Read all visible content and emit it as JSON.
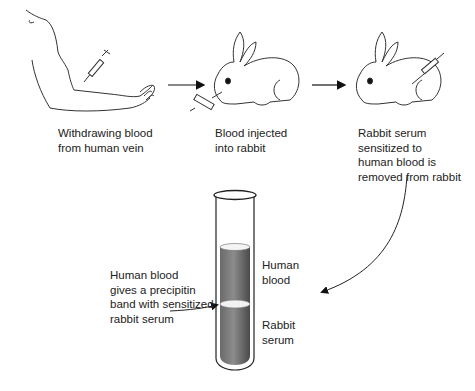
{
  "diagram": {
    "steps": [
      {
        "id": "withdraw",
        "label": "Withdrawing blood\nfrom human vein"
      },
      {
        "id": "inject",
        "label": "Blood injected\ninto rabbit"
      },
      {
        "id": "remove",
        "label": "Rabbit serum\nsensitized to\nhuman blood is\nremoved from rabbit"
      }
    ],
    "tube": {
      "upper_layer_label": "Human\nblood",
      "lower_layer_label": "Rabbit\nserum",
      "band_label": "Human blood\ngives a precipitin\nband with sensitized\nrabbit serum"
    },
    "colors": {
      "line": "#222222",
      "liquid_dark": "#5a5a5a",
      "liquid_light": "#9a9a9a",
      "band": "#f2f2f2"
    }
  }
}
